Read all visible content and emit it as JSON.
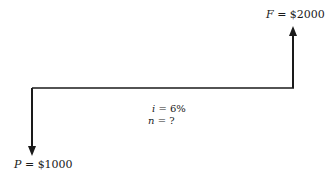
{
  "diagram": {
    "type": "cash-flow",
    "future_value": {
      "symbol": "F",
      "eq": " = ",
      "amount": "$2000"
    },
    "present_value": {
      "symbol": "P",
      "eq": " = ",
      "amount": "$1000"
    },
    "interest": {
      "symbol": "i",
      "eq": " = ",
      "value": "6%"
    },
    "periods": {
      "symbol": "n",
      "eq": " = ",
      "value": "?"
    },
    "colors": {
      "line": "#1a1a1a",
      "background": "#ffffff"
    }
  }
}
